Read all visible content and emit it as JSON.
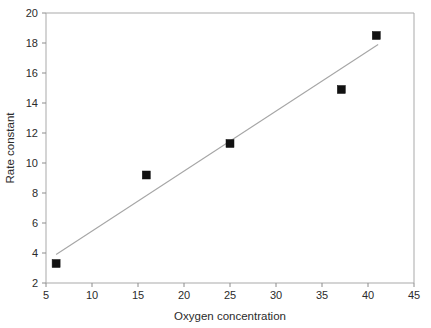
{
  "chart_data": {
    "type": "scatter",
    "title": "",
    "subtitle": "",
    "xlabel": "Oxygen concentration",
    "ylabel": "Rate constant",
    "xlim": [
      5,
      45
    ],
    "ylim": [
      2,
      20
    ],
    "xticks": [
      5,
      10,
      15,
      20,
      25,
      30,
      35,
      40,
      45
    ],
    "xtick_labels": [
      "5",
      "10",
      "15",
      "20",
      "25",
      "30",
      "35",
      "40",
      "45"
    ],
    "yticks": [
      2,
      4,
      6,
      8,
      10,
      12,
      14,
      16,
      18,
      20
    ],
    "ytick_labels": [
      "2",
      "4",
      "6",
      "8",
      "10",
      "12",
      "14",
      "16",
      "18",
      "20"
    ],
    "grid": false,
    "legend": false,
    "legend_position": "none",
    "marker_style": "filled-square",
    "marker_color": "#111111",
    "trendline_color": "#a6a6a6",
    "frame_color": "#a9a9a9",
    "series": [
      {
        "name": "Rate constant vs oxygen concentration",
        "x": [
          6.1,
          15.9,
          25.0,
          37.1,
          40.9
        ],
        "y": [
          3.3,
          9.2,
          11.3,
          14.9,
          18.5
        ]
      }
    ],
    "trendline": {
      "name": "linear fit",
      "x": [
        6.1,
        41.1
      ],
      "y": [
        3.9,
        17.9
      ]
    },
    "annotations": []
  }
}
